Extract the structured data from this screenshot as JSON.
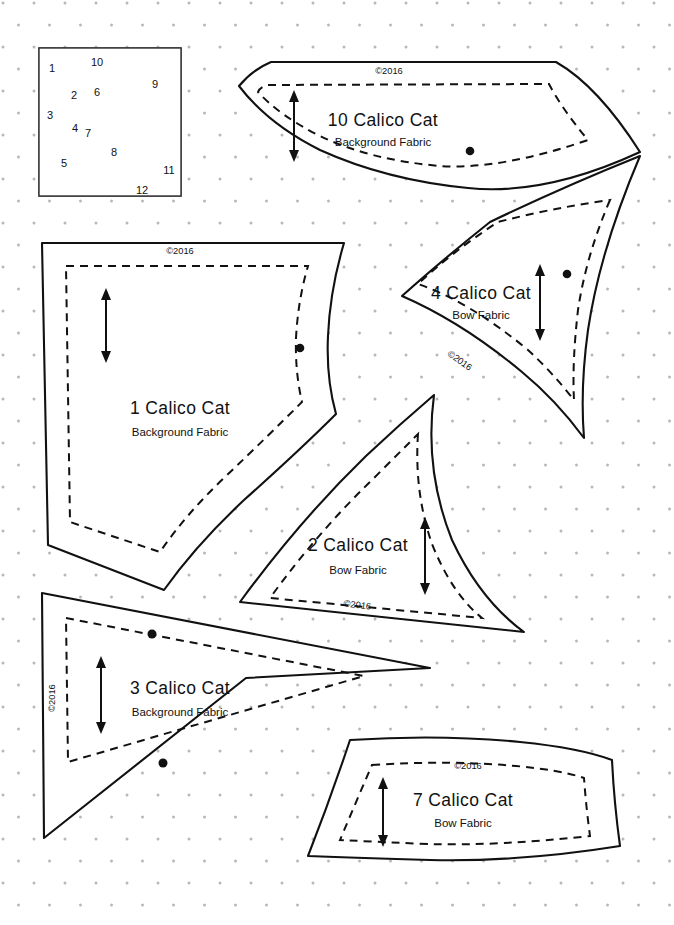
{
  "page": {
    "background_color": "#ffffff",
    "ink_color": "#111111",
    "dot_grid_color": "#b8b8b8"
  },
  "thumbnail": {
    "name": "calico-cat-block-diagram",
    "shaded_color": "#a5a5a5",
    "light_color": "#fbfbfb",
    "numbers": [
      {
        "label": "1",
        "x": 52,
        "y": 72
      },
      {
        "label": "10",
        "x": 97,
        "y": 62
      },
      {
        "label": "9",
        "x": 154,
        "y": 84
      },
      {
        "label": "2",
        "x": 74,
        "y": 97
      },
      {
        "label": "6",
        "x": 96,
        "y": 92
      },
      {
        "label": "3",
        "x": 49,
        "y": 115
      },
      {
        "label": "7",
        "x": 89,
        "y": 128
      },
      {
        "label": "4",
        "x": 75,
        "y": 129
      },
      {
        "label": "8",
        "x": 113,
        "y": 152
      },
      {
        "label": "5",
        "x": 63,
        "y": 163
      },
      {
        "label": "11",
        "x": 168,
        "y": 170
      },
      {
        "label": "12",
        "x": 141,
        "y": 190
      }
    ]
  },
  "pieces": [
    {
      "id": "piece-10",
      "number": "10",
      "label": "10 Calico Cat",
      "fabric": "Background Fabric",
      "copyright": "©2016",
      "label_x": 383,
      "label_y": 126,
      "sub_x": 383,
      "sub_y": 146,
      "copy_x": 389,
      "copy_y": 74,
      "copy_rotate": 0,
      "grain_x": 294,
      "grain_y1": 96,
      "grain_y2": 156,
      "dots": [
        {
          "x": 470,
          "y": 151
        }
      ]
    },
    {
      "id": "piece-4",
      "number": "4",
      "label": "4 Calico Cat",
      "fabric": "Bow Fabric",
      "copyright": "©2016",
      "label_x": 481,
      "label_y": 299,
      "sub_x": 481,
      "sub_y": 319,
      "copy_x": 458,
      "copy_y": 363,
      "copy_rotate": 36,
      "grain_x": 540,
      "grain_y1": 270,
      "grain_y2": 335,
      "dots": [
        {
          "x": 567,
          "y": 274
        }
      ]
    },
    {
      "id": "piece-1",
      "number": "1",
      "label": "1 Calico Cat",
      "fabric": "Background Fabric",
      "copyright": "©2016",
      "label_x": 180,
      "label_y": 414,
      "sub_x": 180,
      "sub_y": 436,
      "copy_x": 180,
      "copy_y": 254,
      "copy_rotate": 0,
      "grain_x": 106,
      "grain_y1": 294,
      "grain_y2": 357,
      "dots": [
        {
          "x": 300,
          "y": 348
        }
      ]
    },
    {
      "id": "piece-2",
      "number": "2",
      "label": "2 Calico Cat",
      "fabric": "Bow Fabric",
      "copyright": "©2016",
      "label_x": 358,
      "label_y": 551,
      "sub_x": 358,
      "sub_y": 574,
      "copy_x": 357,
      "copy_y": 608,
      "copy_rotate": 7,
      "grain_x": 425,
      "grain_y1": 523,
      "grain_y2": 589,
      "dots": []
    },
    {
      "id": "piece-3",
      "number": "3",
      "label": "3 Calico Cat",
      "fabric": "Background Fabric",
      "copyright": "©2016",
      "label_x": 180,
      "label_y": 694,
      "sub_x": 180,
      "sub_y": 716,
      "copy_x": 55,
      "copy_y": 698,
      "copy_rotate": -90,
      "grain_x": 101,
      "grain_y1": 662,
      "grain_y2": 728,
      "dots": [
        {
          "x": 152,
          "y": 634
        },
        {
          "x": 163,
          "y": 763
        }
      ]
    },
    {
      "id": "piece-7",
      "number": "7",
      "label": "7 Calico Cat",
      "fabric": "Bow Fabric",
      "copyright": "©2016",
      "label_x": 463,
      "label_y": 806,
      "sub_x": 463,
      "sub_y": 827,
      "copy_x": 468,
      "copy_y": 769,
      "copy_rotate": 0,
      "grain_x": 383,
      "grain_y1": 783,
      "grain_y2": 841,
      "dots": []
    }
  ]
}
